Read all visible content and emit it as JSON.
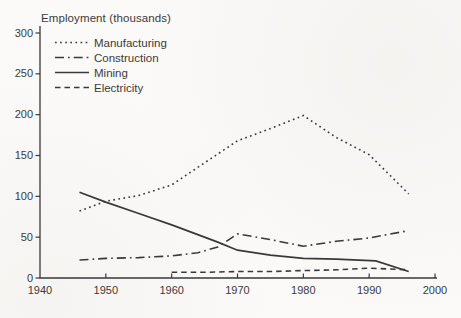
{
  "page": {
    "background_color": "#fbfaf8",
    "ink_color": "#39393b"
  },
  "chart_data": {
    "type": "line",
    "title": "Employment (thousands)",
    "xlabel": "",
    "ylabel": "",
    "xlim": [
      1940,
      2000
    ],
    "ylim": [
      0,
      300
    ],
    "x_ticks": [
      1940,
      1950,
      1960,
      1970,
      1980,
      1990,
      2000
    ],
    "y_ticks": [
      0,
      50,
      100,
      150,
      200,
      250,
      300
    ],
    "grid": false,
    "legend_position": "top-left",
    "series": [
      {
        "name": "Manufacturing",
        "style": "dotted",
        "points": [
          [
            1946,
            82
          ],
          [
            1950,
            94
          ],
          [
            1955,
            101
          ],
          [
            1960,
            114
          ],
          [
            1965,
            141
          ],
          [
            1970,
            168
          ],
          [
            1975,
            183
          ],
          [
            1980,
            199
          ],
          [
            1985,
            172
          ],
          [
            1990,
            151
          ],
          [
            1996,
            103
          ]
        ]
      },
      {
        "name": "Construction",
        "style": "dashdot",
        "points": [
          [
            1946,
            22
          ],
          [
            1950,
            24
          ],
          [
            1955,
            25
          ],
          [
            1960,
            27
          ],
          [
            1964,
            31
          ],
          [
            1967,
            38
          ],
          [
            1970,
            54
          ],
          [
            1975,
            47
          ],
          [
            1980,
            39
          ],
          [
            1985,
            45
          ],
          [
            1990,
            49
          ],
          [
            1996,
            58
          ]
        ]
      },
      {
        "name": "Mining",
        "style": "solid",
        "points": [
          [
            1946,
            105
          ],
          [
            1950,
            93
          ],
          [
            1955,
            79
          ],
          [
            1960,
            65
          ],
          [
            1967,
            44
          ],
          [
            1970,
            34
          ],
          [
            1975,
            28
          ],
          [
            1980,
            24
          ],
          [
            1985,
            23
          ],
          [
            1991,
            21
          ],
          [
            1996,
            8
          ]
        ]
      },
      {
        "name": "Electricity",
        "style": "dashed",
        "points": [
          [
            1960,
            7
          ],
          [
            1965,
            7
          ],
          [
            1970,
            8
          ],
          [
            1975,
            8
          ],
          [
            1980,
            9
          ],
          [
            1985,
            10
          ],
          [
            1990,
            12
          ],
          [
            1996,
            10
          ]
        ]
      }
    ]
  }
}
